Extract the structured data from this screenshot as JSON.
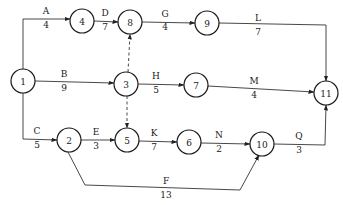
{
  "title": "",
  "nodes": [
    {
      "id": "1",
      "x": 23,
      "y": 81
    },
    {
      "id": "2",
      "x": 69,
      "y": 140
    },
    {
      "id": "3",
      "x": 126,
      "y": 84
    },
    {
      "id": "4",
      "x": 82,
      "y": 21
    },
    {
      "id": "5",
      "x": 127,
      "y": 140
    },
    {
      "id": "6",
      "x": 189,
      "y": 142
    },
    {
      "id": "7",
      "x": 196,
      "y": 85
    },
    {
      "id": "8",
      "x": 130,
      "y": 22
    },
    {
      "id": "9",
      "x": 207,
      "y": 23
    },
    {
      "id": "10",
      "x": 262,
      "y": 144
    },
    {
      "id": "11",
      "x": 326,
      "y": 93
    }
  ],
  "node_radius": 12,
  "edges": [
    {
      "activity": "A",
      "duration": "4",
      "from": "1",
      "to": "4",
      "dummy": false,
      "path": [
        [
          23,
          69
        ],
        [
          23,
          19
        ],
        [
          70,
          19
        ]
      ],
      "label_x": 46,
      "label_top_y": 14,
      "label_bottom_y": 28
    },
    {
      "activity": "D",
      "duration": "7",
      "from": "4",
      "to": "8",
      "dummy": false,
      "path": [
        [
          94,
          21
        ],
        [
          118,
          22
        ]
      ],
      "label_x": 105,
      "label_top_y": 16,
      "label_bottom_y": 30
    },
    {
      "activity": "G",
      "duration": "4",
      "from": "8",
      "to": "9",
      "dummy": false,
      "path": [
        [
          142,
          22
        ],
        [
          195,
          23
        ]
      ],
      "label_x": 165,
      "label_top_y": 17,
      "label_bottom_y": 30
    },
    {
      "activity": "L",
      "duration": "7",
      "from": "9",
      "to": "11",
      "dummy": false,
      "path": [
        [
          219,
          23
        ],
        [
          326,
          25
        ],
        [
          326,
          81
        ]
      ],
      "label_x": 258,
      "label_top_y": 21,
      "label_bottom_y": 35
    },
    {
      "activity": "B",
      "duration": "9",
      "from": "1",
      "to": "3",
      "dummy": false,
      "path": [
        [
          35,
          81
        ],
        [
          114,
          83
        ]
      ],
      "label_x": 64,
      "label_top_y": 77,
      "label_bottom_y": 91
    },
    {
      "activity": "H",
      "duration": "5",
      "from": "3",
      "to": "7",
      "dummy": false,
      "path": [
        [
          138,
          84
        ],
        [
          184,
          85
        ]
      ],
      "label_x": 156,
      "label_top_y": 79,
      "label_bottom_y": 93
    },
    {
      "activity": "M",
      "duration": "4",
      "from": "7",
      "to": "11",
      "dummy": false,
      "path": [
        [
          208,
          86
        ],
        [
          314,
          92
        ]
      ],
      "label_x": 254,
      "label_top_y": 84,
      "label_bottom_y": 98
    },
    {
      "activity": "C",
      "duration": "5",
      "from": "1",
      "to": "2",
      "dummy": false,
      "path": [
        [
          23,
          93
        ],
        [
          23,
          139
        ],
        [
          57,
          140
        ]
      ],
      "label_x": 37,
      "label_top_y": 134,
      "label_bottom_y": 148
    },
    {
      "activity": "E",
      "duration": "3",
      "from": "2",
      "to": "5",
      "dummy": false,
      "path": [
        [
          81,
          140
        ],
        [
          115,
          140
        ]
      ],
      "label_x": 96,
      "label_top_y": 135,
      "label_bottom_y": 149
    },
    {
      "activity": "K",
      "duration": "7",
      "from": "5",
      "to": "6",
      "dummy": false,
      "path": [
        [
          139,
          141
        ],
        [
          177,
          142
        ]
      ],
      "label_x": 154,
      "label_top_y": 136,
      "label_bottom_y": 150
    },
    {
      "activity": "N",
      "duration": "2",
      "from": "6",
      "to": "10",
      "dummy": false,
      "path": [
        [
          201,
          143
        ],
        [
          250,
          144
        ]
      ],
      "label_x": 219,
      "label_top_y": 138,
      "label_bottom_y": 152
    },
    {
      "activity": "Q",
      "duration": "3",
      "from": "10",
      "to": "11",
      "dummy": false,
      "path": [
        [
          274,
          144
        ],
        [
          325,
          145
        ],
        [
          326,
          105
        ]
      ],
      "label_x": 299,
      "label_top_y": 139,
      "label_bottom_y": 153
    },
    {
      "activity": "F",
      "duration": "13",
      "from": "2",
      "to": "10",
      "dummy": false,
      "path": [
        [
          68,
          152
        ],
        [
          85,
          185
        ],
        [
          240,
          190
        ],
        [
          259,
          155
        ]
      ],
      "label_x": 166,
      "label_top_y": 184,
      "label_bottom_y": 198
    },
    {
      "activity": "",
      "duration": "",
      "from": "3",
      "to": "8",
      "dummy": true,
      "path": [
        [
          128,
          72
        ],
        [
          130,
          34
        ]
      ],
      "label_x": 0,
      "label_top_y": 0,
      "label_bottom_y": 0
    },
    {
      "activity": "",
      "duration": "",
      "from": "3",
      "to": "5",
      "dummy": true,
      "path": [
        [
          127,
          96
        ],
        [
          127,
          128
        ]
      ],
      "label_x": 0,
      "label_top_y": 0,
      "label_bottom_y": 0
    }
  ]
}
